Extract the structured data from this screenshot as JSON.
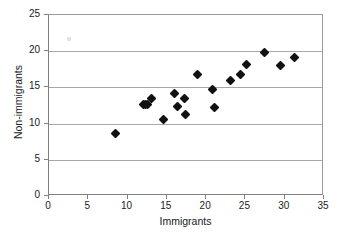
{
  "chart_data": {
    "type": "scatter",
    "title": "",
    "xlabel": "Immigrants",
    "ylabel": "Non-immigrants",
    "xlim": [
      0,
      35
    ],
    "ylim": [
      0,
      25
    ],
    "xticks": [
      0,
      5,
      10,
      15,
      20,
      25,
      30,
      35
    ],
    "yticks": [
      0,
      5,
      10,
      15,
      20,
      25
    ],
    "grid": "horizontal",
    "legend": "none",
    "marker_style": "filled-diamond",
    "marker_color": "#111111",
    "gridline_color": "#a8a8a8",
    "points": [
      {
        "x": 8.5,
        "y": 8.7
      },
      {
        "x": 12.0,
        "y": 12.6
      },
      {
        "x": 12.3,
        "y": 12.6
      },
      {
        "x": 12.5,
        "y": 12.7
      },
      {
        "x": 13.0,
        "y": 13.5
      },
      {
        "x": 14.6,
        "y": 10.5
      },
      {
        "x": 16.0,
        "y": 14.1
      },
      {
        "x": 16.3,
        "y": 12.4
      },
      {
        "x": 17.3,
        "y": 13.5
      },
      {
        "x": 17.4,
        "y": 11.2
      },
      {
        "x": 18.9,
        "y": 16.8
      },
      {
        "x": 20.8,
        "y": 14.7
      },
      {
        "x": 21.0,
        "y": 12.2
      },
      {
        "x": 23.1,
        "y": 16.0
      },
      {
        "x": 24.4,
        "y": 16.8
      },
      {
        "x": 25.1,
        "y": 18.1
      },
      {
        "x": 27.4,
        "y": 19.8
      },
      {
        "x": 29.4,
        "y": 18.0
      },
      {
        "x": 31.3,
        "y": 19.1
      }
    ],
    "artifact": {
      "x": 2.3,
      "y": 21.9
    }
  }
}
